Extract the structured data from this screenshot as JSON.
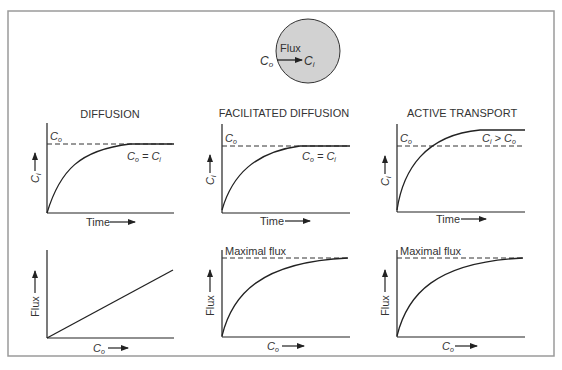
{
  "header": {
    "outside_label": "C",
    "outside_sub": "o",
    "flux_label": "Flux",
    "inside_label": "C",
    "inside_sub": "i"
  },
  "panels": {
    "diffusion": {
      "title": "DIFFUSION",
      "top": {
        "dash_label_main": "C",
        "dash_label_sub": "o",
        "curve_label": "Co = Ci",
        "curve_label_parts": [
          "C",
          "o",
          " = ",
          "C",
          "i"
        ],
        "x_label": "Time",
        "y_label_main": "C",
        "y_label_sub": "i"
      },
      "bottom": {
        "x_label_main": "C",
        "x_label_sub": "o",
        "y_label": "Flux"
      }
    },
    "facilitated": {
      "title": "FACILITATED DIFFUSION",
      "top": {
        "dash_label_main": "C",
        "dash_label_sub": "o",
        "curve_label": "Co = Ci",
        "curve_label_parts": [
          "C",
          "o",
          " = ",
          "C",
          "i"
        ],
        "x_label": "Time",
        "y_label_main": "C",
        "y_label_sub": "i"
      },
      "bottom": {
        "max_label": "Maximal flux",
        "x_label_main": "C",
        "x_label_sub": "o",
        "y_label": "Flux"
      }
    },
    "active": {
      "title": "ACTIVE TRANSPORT",
      "top": {
        "dash_label_main": "C",
        "dash_label_sub": "o",
        "curve_label": "Ci > Co",
        "curve_label_parts": [
          "C",
          "i",
          " > ",
          "C",
          "o"
        ],
        "x_label": "Time",
        "y_label_main": "C",
        "y_label_sub": "i"
      },
      "bottom": {
        "max_label": "Maximal flux",
        "x_label_main": "C",
        "x_label_sub": "o",
        "y_label": "Flux"
      }
    }
  },
  "colors": {
    "frame": "#9a9a9a",
    "cell_fill": "#d2d2d2",
    "line": "#222222"
  }
}
